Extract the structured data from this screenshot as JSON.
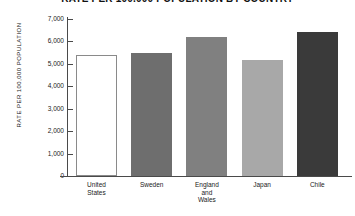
{
  "chart_data": {
    "type": "bar",
    "title": "RATE PER 100,000 POPULATION BY COUNTRY",
    "xlabel": "",
    "ylabel": "RATE PER 100,000 POPULATION",
    "categories": [
      "United States",
      "Sweden",
      "England and Wales",
      "Japan",
      "Chile"
    ],
    "category_lines": [
      [
        "United",
        "States"
      ],
      [
        "Sweden"
      ],
      [
        "England",
        "and",
        "Wales"
      ],
      [
        "Japan"
      ],
      [
        "Chile"
      ]
    ],
    "values": [
      5400,
      5470,
      6200,
      5180,
      6430
    ],
    "bar_colors": [
      "#ffffff",
      "#6e6e6e",
      "#808080",
      "#a8a8a8",
      "#3a3a3a"
    ],
    "ylim": [
      0,
      7000
    ],
    "yticks": [
      0,
      1000,
      2000,
      3000,
      4000,
      5000,
      6000,
      7000
    ],
    "ytick_labels": [
      "0",
      "1,000",
      "2,000",
      "3,000",
      "4,000",
      "5,000",
      "6,000",
      "7,000"
    ],
    "grid": false,
    "legend": "none",
    "axis_color": "#4a4a4a"
  }
}
